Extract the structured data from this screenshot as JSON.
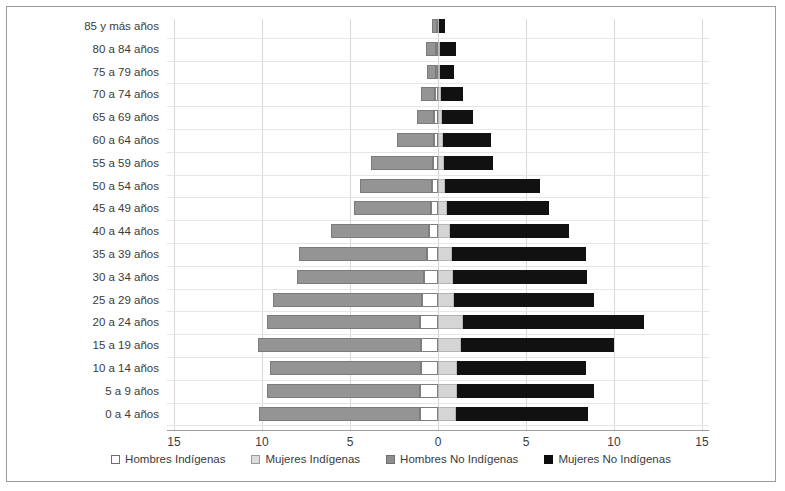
{
  "chart_data": {
    "type": "bar",
    "title": "",
    "subtype": "population-pyramid",
    "orientation": "horizontal",
    "stacked": true,
    "xlabel": "",
    "ylabel": "",
    "xlim": [
      -15,
      15
    ],
    "xticks": [
      15,
      10,
      5,
      0,
      5,
      10,
      15
    ],
    "xtick_labels": [
      "15",
      "10",
      "5",
      "0",
      "5",
      "10",
      "15"
    ],
    "grid": true,
    "legend_position": "bottom",
    "categories": [
      "85 y más años",
      "80 a 84 años",
      "75 a 79 años",
      "70 a 74 años",
      "65 a 69 años",
      "60 a 64 años",
      "55 a 59 años",
      "50 a 54 años",
      "45 a 49 años",
      "40 a 44 años",
      "35 a 39 años",
      "30 a 34 años",
      "25 a 29 años",
      "20 a 24 años",
      "15 a 19 años",
      "10 a 14 años",
      "5 a 9 años",
      "0 a 4 años"
    ],
    "series": [
      {
        "name": "Hombres Indígenas",
        "side": "left",
        "color": "#ffffff",
        "values": [
          0.05,
          0.1,
          0.1,
          0.15,
          0.2,
          0.25,
          0.3,
          0.35,
          0.4,
          0.5,
          0.6,
          0.8,
          0.9,
          1.0,
          0.95,
          0.95,
          1.0,
          1.05
        ]
      },
      {
        "name": "Hombres No Indígenas",
        "side": "left",
        "color": "#949494",
        "values": [
          0.3,
          0.6,
          0.5,
          0.8,
          1.0,
          2.1,
          3.5,
          4.1,
          4.4,
          5.6,
          7.3,
          7.2,
          8.5,
          8.7,
          9.3,
          8.6,
          8.7,
          9.1
        ]
      },
      {
        "name": "Mujeres Indígenas",
        "side": "right",
        "color": "#d5d5d5",
        "values": [
          0.05,
          0.1,
          0.1,
          0.15,
          0.2,
          0.3,
          0.35,
          0.4,
          0.5,
          0.7,
          0.8,
          0.85,
          0.9,
          1.4,
          1.3,
          1.1,
          1.1,
          1.05
        ]
      },
      {
        "name": "Mujeres No Indígenas",
        "side": "right",
        "color": "#111111",
        "values": [
          0.35,
          0.9,
          0.8,
          1.25,
          1.8,
          2.7,
          2.8,
          5.4,
          5.8,
          6.75,
          7.6,
          7.6,
          7.95,
          10.3,
          8.7,
          7.3,
          7.75,
          7.5
        ]
      }
    ]
  },
  "legend": {
    "items": [
      {
        "label": "Hombres Indígenas",
        "key": "hi"
      },
      {
        "label": "Mujeres Indígenas",
        "key": "mi"
      },
      {
        "label": "Hombres No Indígenas",
        "key": "hni"
      },
      {
        "label": "Mujeres No Indígenas",
        "key": "mni"
      }
    ]
  }
}
